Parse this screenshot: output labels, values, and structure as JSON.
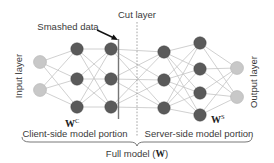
{
  "diagram": {
    "labels": {
      "cut_layer": "Cut layer",
      "smashed_data": "Smashed data",
      "input_layer": "Input layer",
      "output_layer": "Output layer",
      "client_weights": "W",
      "client_weights_sup": "C",
      "server_weights": "W",
      "server_weights_sup": "S",
      "client_portion": "Client-side model portion",
      "server_portion": "Server-side model portion",
      "full_model_prefix": "Full model (",
      "full_model_symbol": "W",
      "full_model_suffix": ")"
    },
    "colors": {
      "input_output_node": "#c8c8c8",
      "hidden_node": "#5a5a5a",
      "edge": "#c4c4c4",
      "cut_line": "#9a9a9a",
      "smashed_line": "#777777",
      "text": "#3a3a3a"
    },
    "layers": [
      {
        "name": "input",
        "x": 40,
        "ys": [
          62,
          90
        ],
        "type": "io"
      },
      {
        "name": "client-hidden-1",
        "x": 77,
        "ys": [
          49,
          79,
          107
        ],
        "type": "hidden"
      },
      {
        "name": "client-hidden-2",
        "x": 111,
        "ys": [
          49,
          79,
          107
        ],
        "type": "hidden"
      },
      {
        "name": "server-hidden-1",
        "x": 164,
        "ys": [
          52,
          80,
          108
        ],
        "type": "hidden"
      },
      {
        "name": "server-hidden-2",
        "x": 200,
        "ys": [
          43,
          69,
          93,
          115
        ],
        "type": "hidden"
      },
      {
        "name": "output",
        "x": 237,
        "ys": [
          68,
          97
        ],
        "type": "io"
      }
    ]
  }
}
